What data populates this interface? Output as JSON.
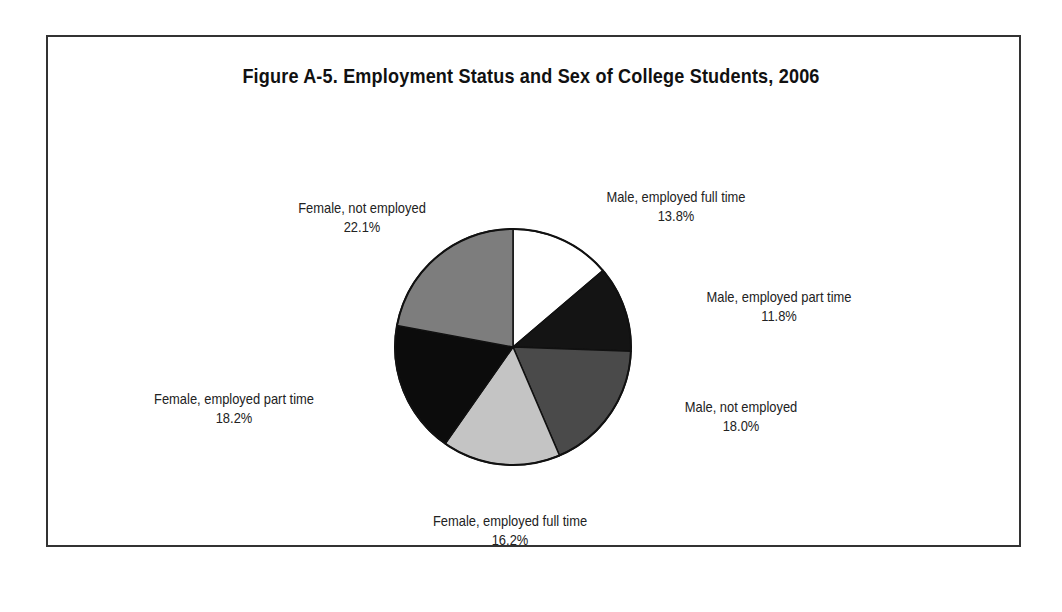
{
  "figure": {
    "title": "Figure A-5. Employment Status and Sex of College Students, 2006"
  },
  "chart_data": {
    "type": "pie",
    "title": "Figure A-5. Employment Status and Sex of College Students, 2006",
    "categories": [
      "Male, employed full time",
      "Male, employed part time",
      "Male, not employed",
      "Female, employed full time",
      "Female, employed part time",
      "Female, not employed"
    ],
    "values": [
      13.8,
      11.8,
      18.0,
      16.2,
      18.2,
      22.1
    ],
    "value_labels": [
      "13.8%",
      "11.8%",
      "18.0%",
      "16.2%",
      "18.2%",
      "22.1%"
    ],
    "colors": [
      "#ffffff",
      "#141414",
      "#4a4a4a",
      "#c4c4c4",
      "#0c0c0c",
      "#7d7d7d"
    ],
    "start_angle": "12 o'clock, clockwise",
    "legend": "none (direct labels)"
  }
}
